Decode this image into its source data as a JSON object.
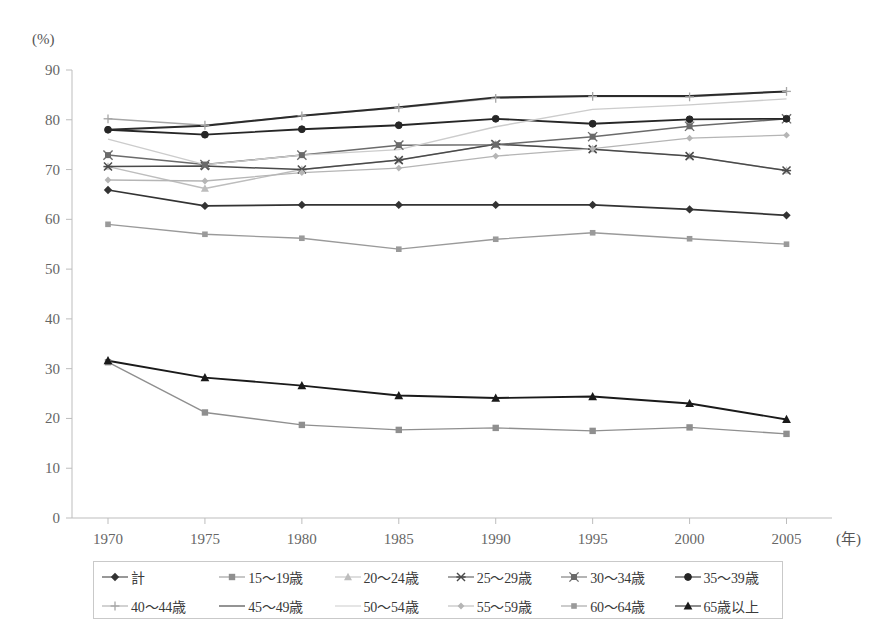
{
  "chart_data": {
    "type": "line",
    "title": "",
    "xlabel": "年",
    "ylabel": "(%)",
    "xlim": [
      1970,
      2005
    ],
    "ylim": [
      0,
      90
    ],
    "ytick_step": 10,
    "grid": false,
    "legend_position": "bottom",
    "x": [
      1970,
      1975,
      1980,
      1985,
      1990,
      1995,
      2000,
      2005
    ],
    "xtick_labels": [
      "1970",
      "1975",
      "1980",
      "1985",
      "1990",
      "1995",
      "2000",
      "2005"
    ],
    "ytick_labels": [
      "0",
      "10",
      "20",
      "30",
      "40",
      "50",
      "60",
      "70",
      "80",
      "90"
    ],
    "series": [
      {
        "name": "計",
        "marker": "diamond",
        "color": "#333333",
        "width": 1.7,
        "values": [
          65.9,
          62.7,
          62.9,
          62.9,
          62.9,
          62.9,
          62.0,
          60.8
        ]
      },
      {
        "name": "15～19歳",
        "marker": "square",
        "color": "#8f8f8f",
        "width": 1.4,
        "values": [
          31.3,
          21.2,
          18.7,
          17.7,
          18.1,
          17.5,
          18.2,
          16.9
        ]
      },
      {
        "name": "20～24歳",
        "marker": "triangle",
        "color": "#bdbdbd",
        "width": 1.4,
        "values": [
          70.6,
          66.2,
          70.0,
          71.9,
          75.1,
          74.1,
          72.7,
          69.8
        ]
      },
      {
        "name": "25～29歳",
        "marker": "star",
        "color": "#4a4a4a",
        "width": 1.5,
        "values": [
          70.6,
          70.7,
          70.0,
          71.9,
          75.1,
          74.1,
          72.7,
          69.8
        ]
      },
      {
        "name": "30～34歳",
        "marker": "star-square",
        "color": "#6b6b6b",
        "width": 1.5,
        "values": [
          72.9,
          71.0,
          72.9,
          74.9,
          75.0,
          76.6,
          78.7,
          80.2
        ]
      },
      {
        "name": "35～39歳",
        "marker": "circle",
        "color": "#262626",
        "width": 1.8,
        "values": [
          78.0,
          77.0,
          78.1,
          78.9,
          80.2,
          79.2,
          80.1,
          80.2
        ]
      },
      {
        "name": "40～44歳",
        "marker": "plus",
        "color": "#a6a6a6",
        "width": 1.4,
        "values": [
          80.2,
          78.9,
          80.8,
          82.4,
          84.3,
          84.7,
          84.6,
          85.7
        ]
      },
      {
        "name": "45～49歳",
        "marker": "none",
        "color": "#2b2b2b",
        "width": 2.0,
        "values": [
          78.0,
          78.8,
          80.8,
          82.5,
          84.5,
          84.8,
          84.8,
          85.7
        ]
      },
      {
        "name": "50～54歳",
        "marker": "none",
        "color": "#cccccc",
        "width": 1.4,
        "values": [
          76.1,
          71.0,
          72.9,
          74.0,
          78.6,
          82.1,
          83.0,
          84.2
        ]
      },
      {
        "name": "55～59歳",
        "marker": "diamond-small",
        "color": "#b5b5b5",
        "width": 1.3,
        "values": [
          67.9,
          67.7,
          69.4,
          70.3,
          72.7,
          74.2,
          76.3,
          76.9
        ]
      },
      {
        "name": "60～64歳",
        "marker": "square-small",
        "color": "#9a9a9a",
        "width": 1.3,
        "values": [
          59.0,
          57.0,
          56.2,
          54.0,
          56.0,
          57.3,
          56.1,
          55.0
        ]
      },
      {
        "name": "65歳以上",
        "marker": "triangle-filled",
        "color": "#1a1a1a",
        "width": 1.9,
        "values": [
          31.6,
          28.2,
          26.6,
          24.6,
          24.1,
          24.4,
          23.0,
          19.8
        ]
      }
    ]
  },
  "axes": {
    "y_unit": "(%)",
    "x_unit": "(年)"
  },
  "legend": {
    "row1": [
      {
        "label": "計",
        "color": "#333333",
        "marker": "diamond"
      },
      {
        "label": "15～19歳",
        "color": "#8f8f8f",
        "marker": "square"
      },
      {
        "label": "20～24歳",
        "color": "#bdbdbd",
        "marker": "triangle"
      },
      {
        "label": "25～29歳",
        "color": "#4a4a4a",
        "marker": "star"
      },
      {
        "label": "30～34歳",
        "color": "#6b6b6b",
        "marker": "star-square"
      },
      {
        "label": "35～39歳",
        "color": "#262626",
        "marker": "circle"
      }
    ],
    "row2": [
      {
        "label": "40～44歳",
        "color": "#a6a6a6",
        "marker": "plus"
      },
      {
        "label": "45～49歳",
        "color": "#2b2b2b",
        "marker": "none"
      },
      {
        "label": "50～54歳",
        "color": "#cccccc",
        "marker": "none"
      },
      {
        "label": "55～59歳",
        "color": "#b5b5b5",
        "marker": "diamond-small"
      },
      {
        "label": "60～64歳",
        "color": "#9a9a9a",
        "marker": "square-small"
      },
      {
        "label": "65歳以上",
        "color": "#1a1a1a",
        "marker": "triangle-filled"
      }
    ]
  }
}
